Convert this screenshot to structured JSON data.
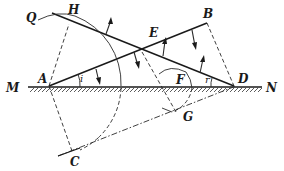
{
  "diagram": {
    "points": {
      "Q": "Q",
      "H": "H",
      "B": "B",
      "E": "E",
      "M": "M",
      "A": "A",
      "F": "F",
      "D": "D",
      "N": "N",
      "G": "G",
      "C": "C"
    },
    "angles": {
      "incidence": "i",
      "refraction": "r"
    }
  }
}
